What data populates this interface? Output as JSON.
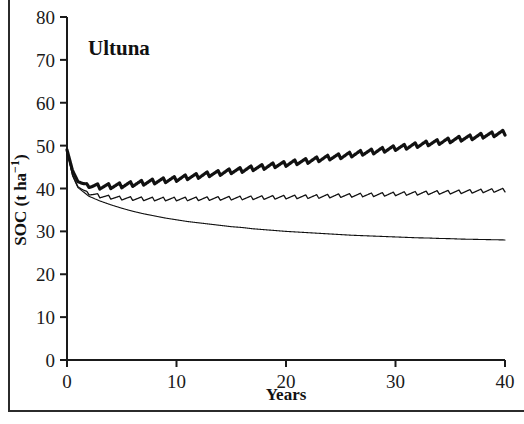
{
  "figure": {
    "panel_label": "Ultuna",
    "background_color": "#ffffff",
    "line_color": "#111111"
  },
  "chart_data": {
    "type": "line",
    "title": "Ultuna",
    "xlabel": "Years",
    "ylabel": "SOC (t ha−1)",
    "xlim": [
      0,
      40
    ],
    "ylim": [
      0,
      80
    ],
    "xticks": [
      0,
      10,
      20,
      30,
      40
    ],
    "yticks": [
      0,
      10,
      20,
      30,
      40,
      50,
      60,
      70,
      80
    ],
    "xtick_labels": [
      "0",
      "10",
      "20",
      "30",
      "40"
    ],
    "ytick_labels": [
      "0",
      "10",
      "20",
      "30",
      "40",
      "50",
      "60",
      "70",
      "80"
    ],
    "grid": false,
    "legend": false,
    "annotations": [
      "Ultuna"
    ],
    "oscillation_note": "All series show annual sawtooth oscillations (one cycle per year) superimposed on the smooth trend.",
    "x": [
      0,
      0.5,
      1,
      2,
      3,
      4,
      5,
      6,
      7,
      8,
      9,
      10,
      11,
      12,
      13,
      14,
      15,
      16,
      17,
      18,
      19,
      20,
      21,
      22,
      23,
      24,
      25,
      26,
      27,
      28,
      29,
      30,
      31,
      32,
      33,
      34,
      35,
      36,
      37,
      38,
      39,
      40
    ],
    "series": [
      {
        "name": "upper-thick",
        "style": "thick-solid",
        "stroke_width": 3.2,
        "amplitude": 1.15,
        "values": [
          49.0,
          44.2,
          41.6,
          40.6,
          40.4,
          40.5,
          40.7,
          41.0,
          41.3,
          41.6,
          41.9,
          42.2,
          42.6,
          42.9,
          43.3,
          43.6,
          44.0,
          44.3,
          44.7,
          45.0,
          45.4,
          45.7,
          46.1,
          46.4,
          46.8,
          47.2,
          47.5,
          47.9,
          48.3,
          48.6,
          49.0,
          49.4,
          49.7,
          50.1,
          50.5,
          50.8,
          51.2,
          51.6,
          51.9,
          52.3,
          52.6,
          53.0
        ]
      },
      {
        "name": "middle-thin",
        "style": "thin-solid-oscillating",
        "stroke_width": 1.3,
        "amplitude": 0.85,
        "values": [
          49.0,
          43.2,
          40.4,
          38.8,
          38.2,
          37.9,
          37.7,
          37.6,
          37.55,
          37.5,
          37.5,
          37.5,
          37.52,
          37.55,
          37.6,
          37.65,
          37.7,
          37.75,
          37.8,
          37.85,
          37.9,
          37.95,
          38.0,
          38.05,
          38.1,
          38.2,
          38.3,
          38.35,
          38.45,
          38.5,
          38.6,
          38.7,
          38.8,
          38.85,
          38.95,
          39.05,
          39.1,
          39.2,
          39.3,
          39.4,
          39.5,
          39.6
        ]
      },
      {
        "name": "lower-thin",
        "style": "thin-solid-smooth",
        "stroke_width": 1.1,
        "amplitude": 0.0,
        "values": [
          49.0,
          43.0,
          40.2,
          38.2,
          37.1,
          36.2,
          35.4,
          34.7,
          34.1,
          33.6,
          33.1,
          32.7,
          32.3,
          32.0,
          31.7,
          31.4,
          31.1,
          30.9,
          30.6,
          30.4,
          30.2,
          30.0,
          29.85,
          29.7,
          29.55,
          29.4,
          29.25,
          29.1,
          29.0,
          28.9,
          28.8,
          28.7,
          28.6,
          28.5,
          28.45,
          28.35,
          28.3,
          28.2,
          28.15,
          28.1,
          28.05,
          28.0
        ]
      }
    ]
  }
}
